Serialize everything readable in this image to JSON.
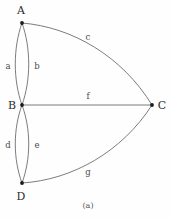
{
  "figure": {
    "caption": "(a)",
    "caption_x": 88,
    "caption_y": 206,
    "background_color": "#fefefe",
    "stroke_color": "#5a5a5a",
    "vertex_color": "#1a1a1a"
  },
  "chart_data": {
    "type": "diagram",
    "subtype": "multigraph",
    "title": "(a)",
    "vertices": [
      {
        "id": "A",
        "label": "A",
        "x": 22,
        "y": 23,
        "label_x": 21,
        "label_y": 10
      },
      {
        "id": "B",
        "label": "B",
        "x": 22,
        "y": 105,
        "label_x": 12,
        "label_y": 105
      },
      {
        "id": "C",
        "label": "C",
        "x": 152,
        "y": 105,
        "label_x": 162,
        "label_y": 105
      },
      {
        "id": "D",
        "label": "D",
        "x": 22,
        "y": 183,
        "label_x": 21,
        "label_y": 196
      }
    ],
    "edges": [
      {
        "id": "a",
        "label": "a",
        "from": "A",
        "to": "B",
        "curve": "left",
        "bulge": 8,
        "label_x": 8,
        "label_y": 66,
        "path": "M 22 23 C 13 48, 13 80, 22 105"
      },
      {
        "id": "b",
        "label": "b",
        "from": "A",
        "to": "B",
        "curve": "right",
        "bulge": 8,
        "label_x": 37,
        "label_y": 66,
        "path": "M 22 23 C 31 48, 31 80, 22 105"
      },
      {
        "id": "c",
        "label": "c",
        "from": "A",
        "to": "C",
        "curve": "up",
        "bulge": 16,
        "label_x": 88,
        "label_y": 37,
        "path": "M 22 23 C 72 27, 122 56, 152 105"
      },
      {
        "id": "d",
        "label": "d",
        "from": "B",
        "to": "D",
        "curve": "left",
        "bulge": 8,
        "label_x": 8,
        "label_y": 145,
        "path": "M 22 105 C 13 129, 13 159, 22 183"
      },
      {
        "id": "e",
        "label": "e",
        "from": "B",
        "to": "D",
        "curve": "right",
        "bulge": 8,
        "label_x": 37,
        "label_y": 145,
        "path": "M 22 105 C 31 129, 31 159, 22 183"
      },
      {
        "id": "f",
        "label": "f",
        "from": "B",
        "to": "C",
        "curve": "straight",
        "bulge": 0,
        "label_x": 88,
        "label_y": 96,
        "path": "M 22 105 L 152 105"
      },
      {
        "id": "g",
        "label": "g",
        "from": "D",
        "to": "C",
        "curve": "down",
        "bulge": 16,
        "label_x": 88,
        "label_y": 172,
        "path": "M 22 183 C 72 180, 122 152, 152 105"
      }
    ],
    "vertex_count": 4,
    "edge_count": 7,
    "edge_labels": [
      "a",
      "b",
      "c",
      "d",
      "e",
      "f",
      "g"
    ],
    "vertex_labels": [
      "A",
      "B",
      "C",
      "D"
    ]
  }
}
